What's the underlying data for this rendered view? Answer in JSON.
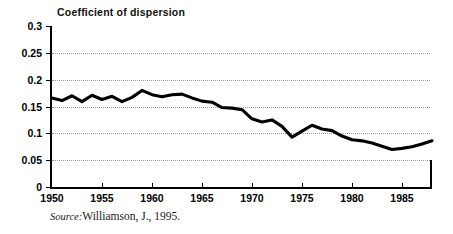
{
  "figure": {
    "title": "Coefficient of dispersion",
    "source_label": "Source:",
    "source_text": "Williamson, J., 1995."
  },
  "chart_data": {
    "type": "line",
    "title": "Coefficient of dispersion",
    "xlabel": "",
    "ylabel": "Coefficient of dispersion",
    "xlim": [
      1950,
      1988
    ],
    "ylim": [
      0,
      0.3
    ],
    "ytick_values": [
      0,
      0.05,
      0.1,
      0.15,
      0.2,
      0.25,
      0.3
    ],
    "ytick_labels": [
      "0",
      "0.05",
      "0.1",
      "0.15",
      "0.2",
      "0.25",
      "0.3"
    ],
    "xtick_values": [
      1950,
      1955,
      1960,
      1965,
      1970,
      1975,
      1980,
      1985
    ],
    "xtick_labels": [
      "1950",
      "1955",
      "1960",
      "1965",
      "1970",
      "1975",
      "1980",
      "1985"
    ],
    "grid": "horizontal-dotted",
    "legend": "none",
    "line_color": "#000000",
    "x": [
      1950,
      1951,
      1952,
      1953,
      1954,
      1955,
      1956,
      1957,
      1958,
      1959,
      1960,
      1961,
      1962,
      1963,
      1964,
      1965,
      1966,
      1967,
      1968,
      1969,
      1970,
      1971,
      1972,
      1973,
      1974,
      1975,
      1976,
      1977,
      1978,
      1979,
      1980,
      1981,
      1982,
      1983,
      1984,
      1985,
      1986,
      1987,
      1988
    ],
    "values": [
      0.166,
      0.161,
      0.17,
      0.159,
      0.171,
      0.163,
      0.169,
      0.159,
      0.167,
      0.18,
      0.172,
      0.168,
      0.172,
      0.173,
      0.166,
      0.16,
      0.158,
      0.148,
      0.147,
      0.144,
      0.127,
      0.121,
      0.125,
      0.113,
      0.093,
      0.104,
      0.115,
      0.108,
      0.105,
      0.095,
      0.088,
      0.086,
      0.082,
      0.076,
      0.07,
      0.072,
      0.075,
      0.08,
      0.086
    ],
    "series": [
      {
        "name": "Coefficient of dispersion",
        "values": [
          0.166,
          0.161,
          0.17,
          0.159,
          0.171,
          0.163,
          0.169,
          0.159,
          0.167,
          0.18,
          0.172,
          0.168,
          0.172,
          0.173,
          0.166,
          0.16,
          0.158,
          0.148,
          0.147,
          0.144,
          0.127,
          0.121,
          0.125,
          0.113,
          0.093,
          0.104,
          0.115,
          0.108,
          0.105,
          0.095,
          0.088,
          0.086,
          0.082,
          0.076,
          0.07,
          0.072,
          0.075,
          0.08,
          0.086
        ]
      }
    ],
    "annotations": []
  }
}
